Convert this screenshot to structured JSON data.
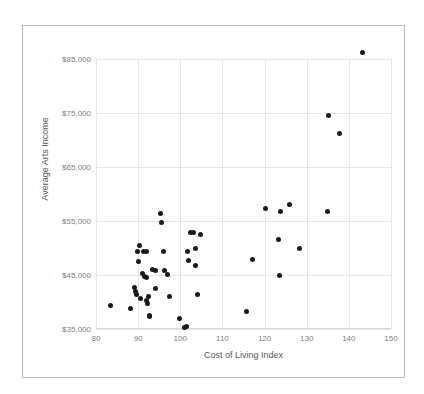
{
  "chart_data": {
    "type": "scatter",
    "title": "",
    "xlabel": "Cost of Living Index",
    "ylabel": "Average Arts Income",
    "xlim": [
      80,
      150
    ],
    "ylim": [
      35000,
      85000
    ],
    "xticks": [
      "80",
      "90",
      "100",
      "110",
      "120",
      "130",
      "140",
      "150"
    ],
    "xtick_values": [
      80,
      90,
      100,
      110,
      120,
      130,
      140,
      150
    ],
    "yticks": [
      "$35,000",
      "$45,000",
      "$55,000",
      "$65,000",
      "$75,000",
      "$85,000"
    ],
    "ytick_values": [
      35000,
      45000,
      55000,
      65000,
      75000,
      85000
    ],
    "grid": true,
    "legend": false,
    "marker_color": "#1a1a1a",
    "gridline_color": "#e6e6e6",
    "tick_label_color": "#808080",
    "axis_title_color": "#595959",
    "border_color": "#b8b8b8",
    "points": [
      [
        83.5,
        39300
      ],
      [
        88.3,
        38800
      ],
      [
        89.1,
        42600
      ],
      [
        89.3,
        41900
      ],
      [
        89.6,
        41400
      ],
      [
        89.9,
        49400
      ],
      [
        90.2,
        47500
      ],
      [
        90.4,
        50400
      ],
      [
        90.6,
        40600
      ],
      [
        91.0,
        45200
      ],
      [
        91.3,
        49300
      ],
      [
        91.6,
        44700
      ],
      [
        91.9,
        44500
      ],
      [
        91.9,
        40300
      ],
      [
        92.1,
        49400
      ],
      [
        92.2,
        39700
      ],
      [
        92.5,
        41000
      ],
      [
        92.6,
        37500
      ],
      [
        92.7,
        37300
      ],
      [
        93.3,
        46000
      ],
      [
        94.0,
        42500
      ],
      [
        94.2,
        45900
      ],
      [
        95.4,
        56300
      ],
      [
        95.5,
        54700
      ],
      [
        96.0,
        49400
      ],
      [
        96.3,
        45900
      ],
      [
        97.0,
        45100
      ],
      [
        97.4,
        41000
      ],
      [
        99.8,
        36900
      ],
      [
        101.0,
        35200
      ],
      [
        101.4,
        35500
      ],
      [
        101.8,
        49400
      ],
      [
        102.0,
        47700
      ],
      [
        102.5,
        52900
      ],
      [
        103.2,
        52900
      ],
      [
        103.5,
        49900
      ],
      [
        103.6,
        46700
      ],
      [
        104.0,
        41300
      ],
      [
        104.8,
        52500
      ],
      [
        115.7,
        38300
      ],
      [
        117.2,
        47900
      ],
      [
        120.2,
        57400
      ],
      [
        123.3,
        51500
      ],
      [
        123.5,
        45000
      ],
      [
        123.8,
        56700
      ],
      [
        125.9,
        58100
      ],
      [
        128.3,
        49900
      ],
      [
        134.9,
        56700
      ],
      [
        135.2,
        74500
      ],
      [
        137.8,
        71200
      ],
      [
        143.2,
        86200
      ]
    ]
  }
}
